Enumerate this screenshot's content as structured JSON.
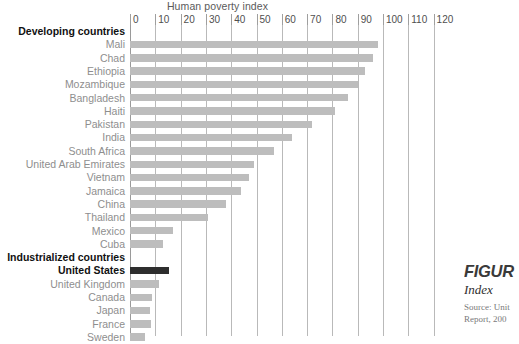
{
  "chart_data": {
    "type": "bar",
    "orientation": "horizontal",
    "title": "Human poverty index",
    "xlabel": "",
    "ylabel": "",
    "xlim": [
      0,
      125
    ],
    "grid": true,
    "legend": null,
    "tick_values": [
      0,
      10,
      20,
      30,
      40,
      50,
      60,
      70,
      80,
      90,
      100,
      110,
      120
    ],
    "tick_labels": [
      "0",
      "10",
      "20",
      "30",
      "40",
      "50",
      "60",
      "70",
      "80",
      "90",
      "100",
      "110",
      "120"
    ],
    "groups": [
      {
        "label": "Developing countries",
        "categories": [
          "Mali",
          "Chad",
          "Ethiopia",
          "Mozambique",
          "Bangladesh",
          "Haiti",
          "Pakistan",
          "India",
          "South Africa",
          "United Arab Emirates",
          "Vietnam",
          "Jamaica",
          "China",
          "Thailand",
          "Mexico",
          "Cuba"
        ],
        "values": [
          98,
          96,
          93,
          90,
          86,
          81,
          72,
          64,
          57,
          49,
          47,
          44,
          38,
          31,
          17,
          13
        ],
        "highlight": []
      },
      {
        "label": "Industrialized countries",
        "categories": [
          "United States",
          "United Kingdom",
          "Canada",
          "Japan",
          "France",
          "Sweden"
        ],
        "values": [
          15.5,
          11.5,
          8.6,
          8.0,
          8.3,
          6.0
        ],
        "highlight": [
          "United States"
        ]
      }
    ],
    "colors": {
      "bar": "#bdbdbd",
      "bar_highlight": "#2e2e2e",
      "gridline": "#b9b9b9",
      "axis": "#9a9a9a",
      "label": "#8e8e8e",
      "label_emphasis": "#111111"
    }
  },
  "figure_caption": {
    "figure_word": "FIGUR",
    "subtitle": "Index",
    "source_line1": "Source: Unit",
    "source_line2": "Report, 200"
  }
}
